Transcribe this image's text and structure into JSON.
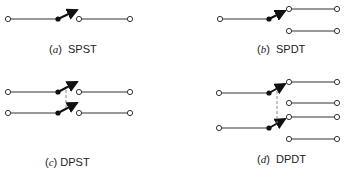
{
  "figure": {
    "panels": [
      {
        "id": "a",
        "letter": "a",
        "name": "SPST"
      },
      {
        "id": "b",
        "letter": "b",
        "name": "SPDT"
      },
      {
        "id": "c",
        "letter": "c",
        "name": "DPST"
      },
      {
        "id": "d",
        "letter": "d",
        "name": "DPDT"
      }
    ]
  },
  "colors": {
    "line": "#333333",
    "pivot": "#111111",
    "ganged_link": "#888888"
  }
}
